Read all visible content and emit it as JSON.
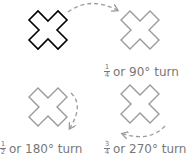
{
  "colors": {
    "original": "#000000",
    "rotated": "#9a9a9a",
    "arrow": "#9a9a9a",
    "text": "#777777"
  },
  "shapes": [
    {
      "id": "original",
      "role": "original cross"
    },
    {
      "id": "quarter",
      "role": "rotated 90°"
    },
    {
      "id": "half",
      "role": "rotated 180°"
    },
    {
      "id": "three-quarter",
      "role": "rotated 270°"
    }
  ],
  "labels": [
    {
      "num": "1",
      "den": "4",
      "text": "or 90° turn"
    },
    {
      "num": "1",
      "den": "2",
      "text": "or 180° turn"
    },
    {
      "num": "3",
      "den": "4",
      "text": "or 270° turn"
    }
  ]
}
